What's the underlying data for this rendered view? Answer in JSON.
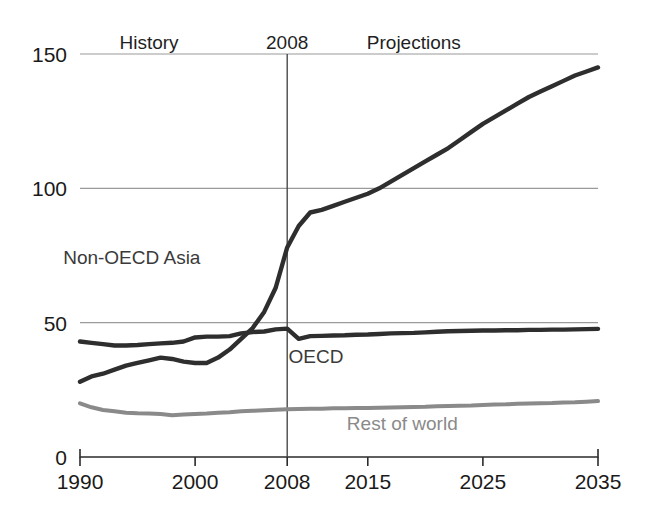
{
  "chart_data": {
    "type": "line",
    "title": "",
    "xlabel": "",
    "ylabel": "",
    "xlim": [
      1990,
      2035
    ],
    "ylim": [
      0,
      150
    ],
    "grid": true,
    "legend_position": "inline-annotations",
    "x_ticks": [
      "1990",
      "2000",
      "2008",
      "2015",
      "2025",
      "2035"
    ],
    "x_tick_values": [
      1990,
      2000,
      2008,
      2015,
      2025,
      2035
    ],
    "y_ticks": [
      "0",
      "50",
      "100",
      "150"
    ],
    "y_tick_values": [
      0,
      50,
      100,
      150
    ],
    "annotations": [
      {
        "text": "History",
        "x": 1996,
        "y": 152
      },
      {
        "text": "2008",
        "x": 2008,
        "y": 152
      },
      {
        "text": "Projections",
        "x": 2019,
        "y": 152
      }
    ],
    "divider_year": 2008,
    "x": [
      1990,
      1991,
      1992,
      1993,
      1994,
      1995,
      1996,
      1997,
      1998,
      1999,
      2000,
      2001,
      2002,
      2003,
      2004,
      2005,
      2006,
      2007,
      2008,
      2009,
      2010,
      2011,
      2012,
      2013,
      2014,
      2015,
      2016,
      2017,
      2018,
      2019,
      2020,
      2021,
      2022,
      2023,
      2024,
      2025,
      2026,
      2027,
      2028,
      2029,
      2030,
      2031,
      2032,
      2033,
      2034,
      2035
    ],
    "series": [
      {
        "name": "Non-OECD Asia",
        "label": "Non-OECD Asia",
        "color": "#2e2e2e",
        "label_x": 1994.5,
        "label_y": 72,
        "values": [
          28,
          30,
          31,
          32.5,
          34,
          35,
          36,
          37,
          36.5,
          35.5,
          35,
          35,
          37,
          40,
          44,
          48,
          54,
          63,
          78,
          86,
          91,
          92,
          93.5,
          95,
          96.5,
          98,
          100,
          102.5,
          105,
          107.5,
          110,
          112.5,
          115,
          118,
          121,
          124,
          126.5,
          129,
          131.5,
          134,
          136,
          138,
          140,
          142,
          143.5,
          145
        ]
      },
      {
        "name": "OECD",
        "label": "OECD",
        "color": "#2e2e2e",
        "label_x": 2010.5,
        "label_y": 35,
        "values": [
          43,
          42.5,
          42,
          41.5,
          41.5,
          41.7,
          42,
          42.3,
          42.5,
          43,
          44.5,
          44.8,
          44.8,
          45,
          46,
          46.5,
          46.7,
          47.5,
          47.8,
          44,
          45,
          45.1,
          45.2,
          45.3,
          45.5,
          45.6,
          45.8,
          46,
          46.1,
          46.2,
          46.4,
          46.6,
          46.8,
          46.9,
          47,
          47.1,
          47.1,
          47.2,
          47.2,
          47.3,
          47.3,
          47.4,
          47.4,
          47.5,
          47.6,
          47.7
        ]
      },
      {
        "name": "Rest of world",
        "label": "Rest of world",
        "color": "#8a8a8a",
        "label_x": 2018,
        "label_y": 10,
        "values": [
          20,
          18.5,
          17.5,
          17,
          16.5,
          16.3,
          16.2,
          16,
          15.5,
          15.8,
          16,
          16.2,
          16.5,
          16.7,
          17,
          17.2,
          17.4,
          17.6,
          17.8,
          17.9,
          18,
          18,
          18.1,
          18.1,
          18.2,
          18.2,
          18.3,
          18.4,
          18.5,
          18.6,
          18.7,
          18.9,
          19,
          19.1,
          19.2,
          19.4,
          19.5,
          19.6,
          19.8,
          19.9,
          20,
          20.1,
          20.3,
          20.4,
          20.6,
          20.8
        ]
      }
    ]
  }
}
